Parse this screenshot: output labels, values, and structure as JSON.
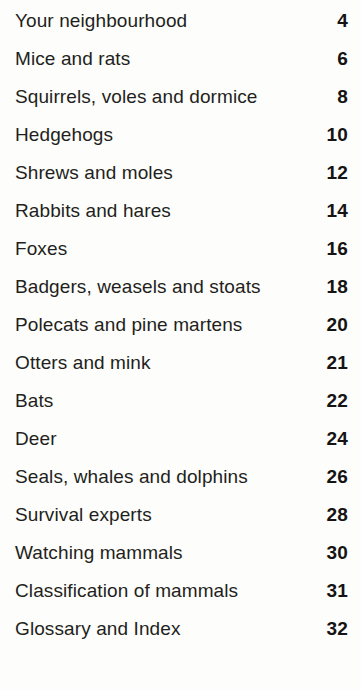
{
  "page": {
    "kind": "book-table-of-contents",
    "background_color": "#fdfdfb",
    "text_color": "#231f20",
    "page_number_color": "#151314"
  },
  "contents": {
    "entries": [
      {
        "title": "Your neighbourhood",
        "page": "4"
      },
      {
        "title": "Mice and rats",
        "page": "6"
      },
      {
        "title": "Squirrels, voles and dormice",
        "page": "8"
      },
      {
        "title": "Hedgehogs",
        "page": "10"
      },
      {
        "title": "Shrews and moles",
        "page": "12"
      },
      {
        "title": "Rabbits and hares",
        "page": "14"
      },
      {
        "title": "Foxes",
        "page": "16"
      },
      {
        "title": "Badgers, weasels and stoats",
        "page": "18"
      },
      {
        "title": "Polecats and pine martens",
        "page": "20"
      },
      {
        "title": "Otters and mink",
        "page": "21"
      },
      {
        "title": "Bats",
        "page": "22"
      },
      {
        "title": "Deer",
        "page": "24"
      },
      {
        "title": "Seals, whales and dolphins",
        "page": "26"
      },
      {
        "title": "Survival experts",
        "page": "28"
      },
      {
        "title": "Watching mammals",
        "page": "30"
      },
      {
        "title": "Classification of mammals",
        "page": "31"
      },
      {
        "title": "Glossary and Index",
        "page": "32"
      }
    ]
  }
}
